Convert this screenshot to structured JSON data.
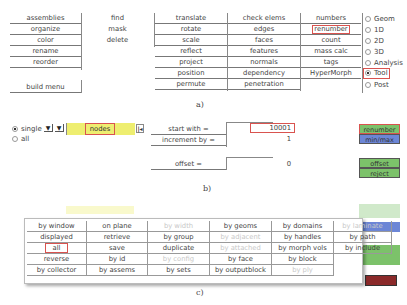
{
  "panel_a": {
    "caption": "a)",
    "col1": [
      "assemblies",
      "organize",
      "color",
      "rename",
      "reorder"
    ],
    "col1_extra": "build menu",
    "col2": [
      "find",
      "mask",
      "delete"
    ],
    "col3": [
      "translate",
      "rotate",
      "scale",
      "reflect",
      "project",
      "position",
      "permute"
    ],
    "col4": [
      "check elems",
      "edges",
      "faces",
      "features",
      "normals",
      "dependency",
      "penetration"
    ],
    "col5": [
      "numbers",
      "renumber",
      "count",
      "mass calc",
      "tags",
      "HyperMorph"
    ],
    "highlighted_item": "renumber",
    "pages": [
      "Geom",
      "1D",
      "2D",
      "3D",
      "Analysis",
      "Tool",
      "Post"
    ],
    "selected_page": "Tool"
  },
  "panel_b": {
    "caption": "b)",
    "mode_options": [
      "single",
      "all"
    ],
    "selected_mode": "single",
    "entity_selector": "nodes",
    "reset_icon": "reset-icon",
    "fields": [
      {
        "label": "start with  =",
        "value": "10001"
      },
      {
        "label": "increment by =",
        "value": "1"
      },
      {
        "label": "offset    =",
        "value": "0"
      }
    ],
    "buttons": {
      "renumber": "renumber",
      "minmax": "min/max",
      "offset": "offset",
      "reject": "reject"
    },
    "colors": {
      "green": "#7cc26a",
      "blue": "#6c86d6",
      "highlight": "#d9534f",
      "yellow": "#eeee70"
    }
  },
  "panel_c": {
    "caption": "c)",
    "popup_grid": [
      [
        {
          "t": "by window",
          "d": false
        },
        {
          "t": "on plane",
          "d": false
        },
        {
          "t": "by width",
          "d": true
        },
        {
          "t": "by geoms",
          "d": false
        },
        {
          "t": "by domains",
          "d": false
        },
        {
          "t": "by laminate",
          "d": true
        }
      ],
      [
        {
          "t": "displayed",
          "d": false
        },
        {
          "t": "retrieve",
          "d": false
        },
        {
          "t": "by group",
          "d": false
        },
        {
          "t": "by adjacent",
          "d": true
        },
        {
          "t": "by handles",
          "d": false
        },
        {
          "t": "by path",
          "d": false
        }
      ],
      [
        {
          "t": "all",
          "d": false
        },
        {
          "t": "save",
          "d": false
        },
        {
          "t": "duplicate",
          "d": false
        },
        {
          "t": "by attached",
          "d": true
        },
        {
          "t": "by morph vols",
          "d": false
        },
        {
          "t": "by include",
          "d": false
        }
      ],
      [
        {
          "t": "reverse",
          "d": false
        },
        {
          "t": "by id",
          "d": false
        },
        {
          "t": "by config",
          "d": true
        },
        {
          "t": "by face",
          "d": false
        },
        {
          "t": "by block",
          "d": false
        },
        {
          "t": "",
          "d": false
        }
      ],
      [
        {
          "t": "by collector",
          "d": false
        },
        {
          "t": "by assems",
          "d": false
        },
        {
          "t": "by sets",
          "d": false
        },
        {
          "t": "by outputblock",
          "d": false
        },
        {
          "t": "by ply",
          "d": true
        },
        {
          "t": "",
          "d": false
        }
      ]
    ],
    "highlighted_item": "all"
  }
}
